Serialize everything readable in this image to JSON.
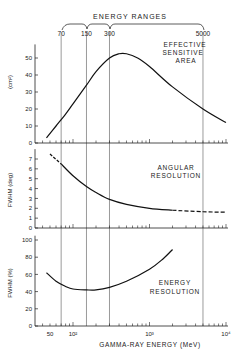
{
  "chart_data": [
    {
      "type": "line",
      "panel": "top",
      "title": "EFFECTIVE SENSITIVE AREA",
      "ylabel": "(cm²)",
      "xlabel": "",
      "xscale": "log",
      "xlim": [
        30,
        12000
      ],
      "ylim": [
        0,
        58
      ],
      "yticks": [
        0,
        10,
        20,
        30,
        40,
        50
      ],
      "x": [
        45,
        60,
        80,
        100,
        150,
        200,
        300,
        400,
        500,
        700,
        1000,
        2000,
        5000,
        10000
      ],
      "values": [
        3,
        10,
        17,
        23,
        34,
        42,
        50,
        52.5,
        52.5,
        50,
        45,
        33,
        20,
        12
      ]
    },
    {
      "type": "line",
      "panel": "middle",
      "title": "ANGULAR RESOLUTION",
      "ylabel": "FWHM (deg)",
      "xscale": "log",
      "xlim": [
        30,
        12000
      ],
      "ylim": [
        0,
        8
      ],
      "yticks": [
        0,
        1,
        2,
        3,
        4,
        5,
        6,
        7
      ],
      "x": [
        50,
        70,
        100,
        150,
        200,
        300,
        500,
        1000,
        2000,
        5000,
        10000
      ],
      "values": [
        7.5,
        6.5,
        5.3,
        4.2,
        3.6,
        2.9,
        2.4,
        2.0,
        1.8,
        1.65,
        1.6
      ],
      "dashed_segments": [
        "x < 70",
        "x > 2000"
      ]
    },
    {
      "type": "line",
      "panel": "bottom",
      "title": "ENERGY RESOLUTION",
      "ylabel": "FWHM (%)",
      "xlabel": "GAMMA-RAY ENERGY (MeV)",
      "xscale": "log",
      "xlim": [
        30,
        12000
      ],
      "ylim": [
        0,
        105
      ],
      "yticks": [
        0,
        20,
        40,
        60,
        80,
        100
      ],
      "xtick_labels": [
        "50",
        "10²",
        "10³",
        "10⁴"
      ],
      "x": [
        45,
        60,
        80,
        100,
        150,
        200,
        300,
        500,
        1000,
        1500,
        2000
      ],
      "values": [
        62,
        52,
        46,
        43,
        42,
        42,
        45,
        52,
        66,
        78,
        89
      ]
    }
  ],
  "energy_ranges": {
    "title": "ENERGY RANGES",
    "boundaries": [
      "70",
      "150",
      "300",
      "5000"
    ]
  },
  "labels": {
    "top_title_1": "EFFECTIVE",
    "top_title_2": "SENSITIVE",
    "top_title_3": "AREA",
    "mid_title_1": "ANGULAR",
    "mid_title_2": "RESOLUTION",
    "bot_title_1": "ENERGY",
    "bot_title_2": "RESOLUTION",
    "top_ylabel": "(cm²)",
    "mid_ylabel": "FWHM (deg)",
    "bot_ylabel": "FWHM  (%)",
    "xlabel": "GAMMA-RAY ENERGY (MeV)",
    "x50": "50",
    "x100": "10²",
    "x1000": "10³",
    "x10000": "10⁴"
  }
}
